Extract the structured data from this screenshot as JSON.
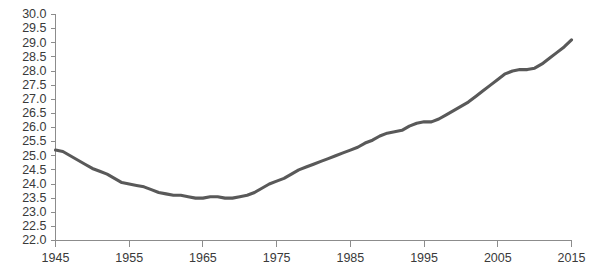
{
  "chart_data": {
    "type": "line",
    "title": "",
    "subtitle": "",
    "xlabel": "",
    "ylabel": "",
    "grid": false,
    "legend": "none",
    "xlim": [
      1945,
      2015
    ],
    "ylim": [
      22.0,
      30.0
    ],
    "x_ticks": [
      1945,
      1955,
      1965,
      1975,
      1985,
      1995,
      2005,
      2015
    ],
    "x_tick_labels": [
      "1945",
      "1955",
      "1965",
      "1975",
      "1985",
      "1995",
      "2005",
      "2015"
    ],
    "y_ticks": [
      22.0,
      22.5,
      23.0,
      23.5,
      24.0,
      24.5,
      25.0,
      25.5,
      26.0,
      26.5,
      27.0,
      27.5,
      28.0,
      28.5,
      29.0,
      29.5,
      30.0
    ],
    "y_tick_labels": [
      "22.0",
      "22.5",
      "23.0",
      "23.5",
      "24.0",
      "24.5",
      "25.0",
      "25.5",
      "26.0",
      "26.5",
      "27.0",
      "27.5",
      "28.0",
      "28.5",
      "29.0",
      "29.5",
      "30.0"
    ],
    "series": [
      {
        "name": "value",
        "color": "#595959",
        "x": [
          1945,
          1946,
          1947,
          1948,
          1949,
          1950,
          1951,
          1952,
          1953,
          1954,
          1955,
          1956,
          1957,
          1958,
          1959,
          1960,
          1961,
          1962,
          1963,
          1964,
          1965,
          1966,
          1967,
          1968,
          1969,
          1970,
          1971,
          1972,
          1973,
          1974,
          1975,
          1976,
          1977,
          1978,
          1979,
          1980,
          1981,
          1982,
          1983,
          1984,
          1985,
          1986,
          1987,
          1988,
          1989,
          1990,
          1991,
          1992,
          1993,
          1994,
          1995,
          1996,
          1997,
          1998,
          1999,
          2000,
          2001,
          2002,
          2003,
          2004,
          2005,
          2006,
          2007,
          2008,
          2009,
          2010,
          2011,
          2012,
          2013,
          2014,
          2015
        ],
        "values": [
          25.2,
          25.15,
          25.0,
          24.85,
          24.7,
          24.55,
          24.45,
          24.35,
          24.2,
          24.05,
          24.0,
          23.95,
          23.9,
          23.8,
          23.7,
          23.65,
          23.6,
          23.6,
          23.55,
          23.5,
          23.5,
          23.55,
          23.55,
          23.5,
          23.5,
          23.55,
          23.6,
          23.7,
          23.85,
          24.0,
          24.1,
          24.2,
          24.35,
          24.5,
          24.6,
          24.7,
          24.8,
          24.9,
          25.0,
          25.1,
          25.2,
          25.3,
          25.45,
          25.55,
          25.7,
          25.8,
          25.85,
          25.9,
          26.05,
          26.15,
          26.2,
          26.2,
          26.3,
          26.45,
          26.6,
          26.75,
          26.9,
          27.1,
          27.3,
          27.5,
          27.7,
          27.9,
          28.0,
          28.05,
          28.05,
          28.1,
          28.25,
          28.45,
          28.65,
          28.85,
          29.1
        ]
      }
    ]
  },
  "axes": {
    "line_color": "#8c8c8c",
    "label_color": "#3a3a3a"
  }
}
